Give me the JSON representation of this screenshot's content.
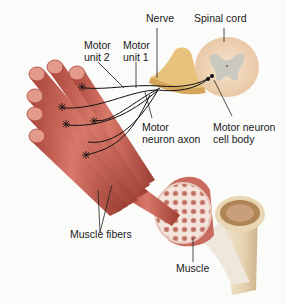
{
  "diagram": {
    "labels": {
      "nerve": "Nerve",
      "spinal_cord": "Spinal cord",
      "motor_unit_2": [
        "Motor",
        "unit 2"
      ],
      "motor_unit_1": [
        "Motor",
        "unit 1"
      ],
      "motor_neuron_axon": [
        "Motor",
        "neuron axon"
      ],
      "motor_neuron_cell_body": [
        "Motor neuron",
        "cell body"
      ],
      "muscle_fibers": "Muscle fibers",
      "muscle": "Muscle"
    },
    "colors": {
      "muscle_red": "#c45a4c",
      "muscle_light": "#e39a8a",
      "nerve_yellow": "#e8c27a",
      "spinal_gray": "#c9c9c0",
      "spinal_outer": "#f1d9be",
      "bone": "#ecdcbc",
      "tendon": "#efe9e2"
    }
  }
}
